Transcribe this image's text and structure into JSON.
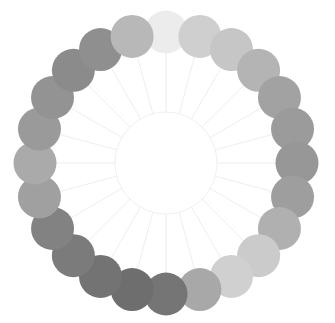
{
  "canvas": {
    "width": 335,
    "height": 323,
    "background": "#ffffff"
  },
  "diagram": {
    "type": "radial-node-ring",
    "node_count": 24,
    "center_x": 166,
    "center_y": 163,
    "ring_radius": 131,
    "node_radius": 21.5,
    "hub_radius": 51,
    "hub_fill": "#ffffff",
    "hub_stroke": "#ededed",
    "hub_stroke_width": 0.9,
    "spoke_color": "#e9e9e9",
    "spoke_width": 0.8,
    "spoke_inner_radius": 51,
    "spoke_outer_radius": 112,
    "start_angle_deg": -90,
    "angle_step_deg": 15
  },
  "chart_data": {
    "type": "scatter",
    "xlabel": "",
    "ylabel": "",
    "legend": [],
    "grid": false,
    "angle_unit": "degrees",
    "nodes": [
      {
        "index": 0,
        "label": "n01",
        "angle": -90,
        "value": 0.08,
        "fill": "#ececec"
      },
      {
        "index": 1,
        "label": "n02",
        "angle": -75,
        "value": 0.22,
        "fill": "#cfcfcf"
      },
      {
        "index": 2,
        "label": "n03",
        "angle": -60,
        "value": 0.27,
        "fill": "#c6c6c6"
      },
      {
        "index": 3,
        "label": "n04",
        "angle": -45,
        "value": 0.38,
        "fill": "#b4b4b4"
      },
      {
        "index": 4,
        "label": "n05",
        "angle": -30,
        "value": 0.48,
        "fill": "#a2a2a2"
      },
      {
        "index": 5,
        "label": "n06",
        "angle": -15,
        "value": 0.52,
        "fill": "#9b9b9b"
      },
      {
        "index": 6,
        "label": "n07",
        "angle": 0,
        "value": 0.55,
        "fill": "#979797"
      },
      {
        "index": 7,
        "label": "n08",
        "angle": 15,
        "value": 0.5,
        "fill": "#9e9e9e"
      },
      {
        "index": 8,
        "label": "n09",
        "angle": 30,
        "value": 0.4,
        "fill": "#b0b0b0"
      },
      {
        "index": 9,
        "label": "n10",
        "angle": 45,
        "value": 0.24,
        "fill": "#cbcbcb"
      },
      {
        "index": 10,
        "label": "n11",
        "angle": 60,
        "value": 0.21,
        "fill": "#d0d0d0"
      },
      {
        "index": 11,
        "label": "n12",
        "angle": 75,
        "value": 0.45,
        "fill": "#a8a8a8"
      },
      {
        "index": 12,
        "label": "n13",
        "angle": 90,
        "value": 0.72,
        "fill": "#757575"
      },
      {
        "index": 13,
        "label": "n14",
        "angle": 105,
        "value": 0.76,
        "fill": "#6e6e6e"
      },
      {
        "index": 14,
        "label": "n15",
        "angle": 120,
        "value": 0.73,
        "fill": "#737373"
      },
      {
        "index": 15,
        "label": "n16",
        "angle": 135,
        "value": 0.68,
        "fill": "#7b7b7b"
      },
      {
        "index": 16,
        "label": "n17",
        "angle": 150,
        "value": 0.64,
        "fill": "#828282"
      },
      {
        "index": 17,
        "label": "n18",
        "angle": 165,
        "value": 0.49,
        "fill": "#a0a0a0"
      },
      {
        "index": 18,
        "label": "n19",
        "angle": 180,
        "value": 0.44,
        "fill": "#aaaaaa"
      },
      {
        "index": 19,
        "label": "n20",
        "angle": 195,
        "value": 0.53,
        "fill": "#9a9a9a"
      },
      {
        "index": 20,
        "label": "n21",
        "angle": 210,
        "value": 0.58,
        "fill": "#939393"
      },
      {
        "index": 21,
        "label": "n22",
        "angle": 225,
        "value": 0.63,
        "fill": "#8b8b8b"
      },
      {
        "index": 22,
        "label": "n23",
        "angle": 240,
        "value": 0.6,
        "fill": "#8f8f8f"
      },
      {
        "index": 23,
        "label": "n24",
        "angle": 255,
        "value": 0.36,
        "fill": "#b8b8b8"
      }
    ]
  }
}
